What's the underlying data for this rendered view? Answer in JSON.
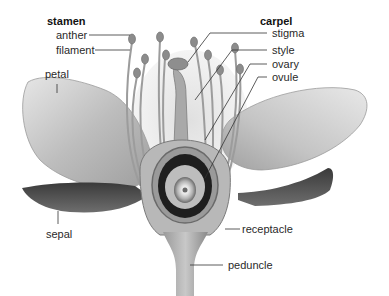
{
  "diagram": {
    "groups": {
      "stamen": {
        "heading": "stamen",
        "parts": [
          "anther",
          "filament"
        ]
      },
      "carpel": {
        "heading": "carpel",
        "parts": [
          "stigma",
          "style",
          "ovary",
          "ovule"
        ]
      }
    },
    "labels": {
      "stamen": "stamen",
      "anther": "anther",
      "filament": "filament",
      "petal": "petal",
      "sepal": "sepal",
      "carpel": "carpel",
      "stigma": "stigma",
      "style": "style",
      "ovary": "ovary",
      "ovule": "ovule",
      "receptacle": "receptacle",
      "peduncle": "peduncle"
    },
    "colors": {
      "background": "#ffffff",
      "petal": "#c9c9c9",
      "sepal": "#555555",
      "ovary_wall": "#8a8a8a",
      "ovary_cavity": "#222222",
      "leader_line": "#333333",
      "text": "#2a2a2a"
    }
  }
}
